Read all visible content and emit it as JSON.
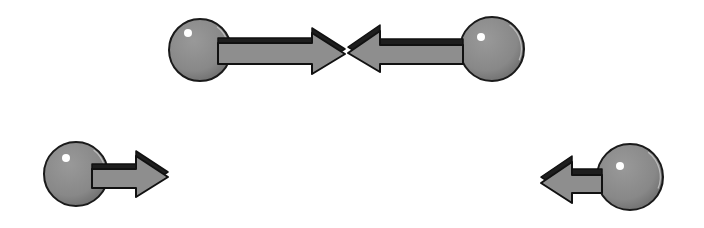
{
  "diagram": {
    "description": "Two pairs of spheres with velocity arrows",
    "colors": {
      "background": "#ffffff",
      "ball_fill": "#8c8c8c",
      "ball_shade": "#6e6e6e",
      "ball_outline": "#1a1a1a",
      "highlight": "#ffffff",
      "arrow_fill": "#8e8e8e",
      "arrow_dark": "#1e1e1e",
      "arrow_outline": "#111111"
    },
    "objects": [
      {
        "id": "top-left",
        "ball": {
          "cx": 200,
          "cy": 50,
          "r": 31,
          "hx": 188,
          "hy": 33,
          "hr": 4
        },
        "arrow": {
          "direction": "right",
          "shaft_x1": 218,
          "shaft_x2": 312,
          "shaft_y1": 43,
          "shaft_y2": 64,
          "head_back_x": 312,
          "tip_x": 345,
          "tip_y": 54,
          "head_y1": 33,
          "head_y2": 74,
          "depth": 5
        }
      },
      {
        "id": "top-right",
        "ball": {
          "cx": 492,
          "cy": 49,
          "r": 32,
          "hx": 481,
          "hy": 37,
          "hr": 4
        },
        "arrow": {
          "direction": "left",
          "shaft_x1": 380,
          "shaft_x2": 463,
          "shaft_y1": 45,
          "shaft_y2": 64,
          "head_back_x": 380,
          "tip_x": 348,
          "tip_y": 53,
          "head_y1": 31,
          "head_y2": 72,
          "depth": 6
        }
      },
      {
        "id": "bottom-left",
        "ball": {
          "cx": 76,
          "cy": 174,
          "r": 32,
          "hx": 66,
          "hy": 158,
          "hr": 4
        },
        "arrow": {
          "direction": "right",
          "shaft_x1": 92,
          "shaft_x2": 136,
          "shaft_y1": 169,
          "shaft_y2": 188,
          "head_back_x": 136,
          "tip_x": 168,
          "tip_y": 177,
          "head_y1": 156,
          "head_y2": 197,
          "depth": 5
        }
      },
      {
        "id": "bottom-right",
        "ball": {
          "cx": 630,
          "cy": 177,
          "r": 33,
          "hx": 620,
          "hy": 166,
          "hr": 4
        },
        "arrow": {
          "direction": "left",
          "shaft_x1": 572,
          "shaft_x2": 602,
          "shaft_y1": 175,
          "shaft_y2": 193,
          "head_back_x": 572,
          "tip_x": 541,
          "tip_y": 183,
          "head_y1": 162,
          "head_y2": 203,
          "depth": 6
        }
      }
    ]
  }
}
